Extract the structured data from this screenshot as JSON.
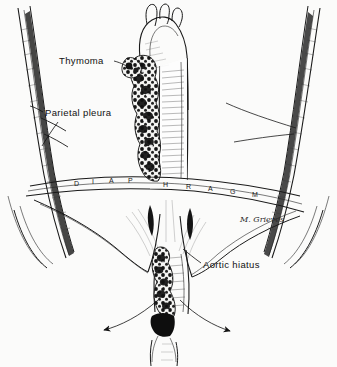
{
  "figure": {
    "medium": "pen-and-ink anatomical line drawing",
    "background_color": "#fbfbfa",
    "ink_color": "#1a1a1a"
  },
  "labels": {
    "thymoma": "Thymoma",
    "parietal_pleura": "Parietal pleura",
    "aortic_hiatus": "Aortic hiatus",
    "diaphragm_letters": [
      "D",
      "I",
      "A",
      "P",
      "H",
      "R",
      "A",
      "G",
      "M"
    ],
    "signature": "M. Grieves"
  },
  "structures": [
    {
      "name": "aortic-arch",
      "description": "aortic arch with three great vessels at top center"
    },
    {
      "name": "descending-aorta",
      "description": "vertically hatched descending thoracic aorta"
    },
    {
      "name": "thymoma-mass",
      "description": "lobulated dark nodular tumor along left side of aorta"
    },
    {
      "name": "diaphragm",
      "description": "dome-shaped muscular diaphragm spanning the chest"
    },
    {
      "name": "left-chest-wall",
      "description": "left rib cage with pleural lining"
    },
    {
      "name": "right-chest-wall",
      "description": "right rib cage with pleural lining"
    },
    {
      "name": "aortic-hiatus",
      "description": "opening in diaphragm transmitting the aorta"
    },
    {
      "name": "spread-arrows",
      "description": "two bold arrows indicating bilateral tumor spread below diaphragm"
    }
  ]
}
